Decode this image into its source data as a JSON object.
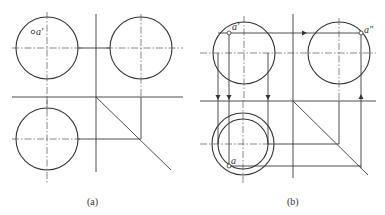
{
  "figure": {
    "panels": [
      {
        "id": "a",
        "caption": "(a)",
        "point_label_front": "a′"
      },
      {
        "id": "b",
        "caption": "(b)",
        "point_label_front": "a′",
        "point_label_side": "a″",
        "point_label_top": "a"
      }
    ],
    "colors": {
      "line": "#3a3a3a",
      "background": "#ffffff"
    }
  }
}
